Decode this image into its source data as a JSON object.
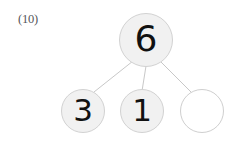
{
  "worksheet": {
    "problem_label": "(10)",
    "background_color": "#ffffff"
  },
  "diagram": {
    "type": "number-bond",
    "title": "",
    "whole": {
      "id": "root",
      "value": "6",
      "filled": true,
      "fill_color": "#f1f1f1",
      "border_color": "#d2d2d2",
      "text_color": "#111111"
    },
    "parts": [
      {
        "id": "part-1",
        "value": "3",
        "filled": true,
        "fill_color": "#f1f1f1",
        "border_color": "#d2d2d2",
        "text_color": "#111111"
      },
      {
        "id": "part-2",
        "value": "1",
        "filled": true,
        "fill_color": "#f1f1f1",
        "border_color": "#d2d2d2",
        "text_color": "#111111"
      },
      {
        "id": "part-3",
        "value": "",
        "filled": false,
        "fill_color": "#ffffff",
        "border_color": "#cfcfcf",
        "text_color": "#111111"
      }
    ],
    "connector_color": "#c8c8c8"
  }
}
